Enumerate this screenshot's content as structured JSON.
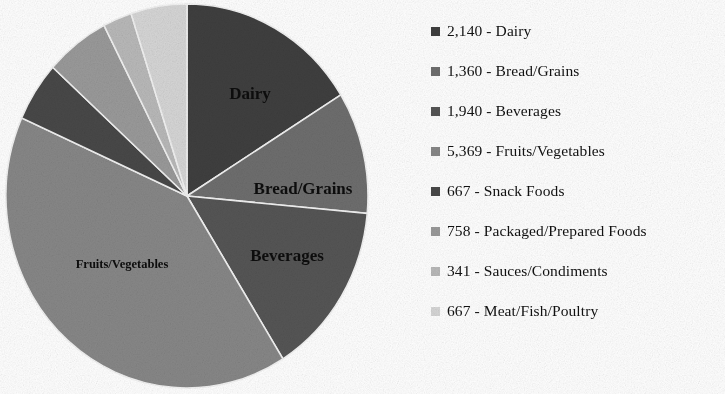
{
  "chart_data": {
    "type": "pie",
    "title": "",
    "legend_position": "right",
    "total": 13242,
    "categories": [
      "Dairy",
      "Bread/Grains",
      "Beverages",
      "Fruits/Vegetables",
      "Snack Foods",
      "Packaged/Prepared Foods",
      "Sauces/Condiments",
      "Meat/Fish/Poultry"
    ],
    "values": [
      2140,
      1360,
      1940,
      5369,
      667,
      758,
      341,
      667
    ],
    "value_labels": [
      "2,140",
      "1,360",
      "1,940",
      "5,369",
      "667",
      "758",
      "341",
      "667"
    ],
    "colors": [
      "#3f3f3f",
      "#6e6e6e",
      "#555555",
      "#878787",
      "#484848",
      "#9a9a9a",
      "#b9b9b9",
      "#d6d6d6"
    ],
    "slices": [
      {
        "label": "Dairy",
        "value": 2140,
        "value_label": "2,140",
        "color": "#3f3f3f",
        "start_angle": 0.0,
        "end_angle": 58.2
      },
      {
        "label": "Bread/Grains",
        "value": 1360,
        "value_label": "1,360",
        "color": "#6e6e6e",
        "start_angle": 58.2,
        "end_angle": 95.2
      },
      {
        "label": "Beverages",
        "value": 1940,
        "value_label": "1,940",
        "color": "#555555",
        "start_angle": 95.2,
        "end_angle": 148.0
      },
      {
        "label": "Fruits/Vegetables",
        "value": 5369,
        "value_label": "5,369",
        "color": "#878787",
        "start_angle": 148.0,
        "end_angle": 294.0
      },
      {
        "label": "Snack Foods",
        "value": 667,
        "value_label": "667",
        "color": "#484848",
        "start_angle": 294.0,
        "end_angle": 312.1
      },
      {
        "label": "Packaged/Prepared Foods",
        "value": 758,
        "value_label": "758",
        "color": "#9a9a9a",
        "start_angle": 312.1,
        "end_angle": 332.7
      },
      {
        "label": "Sauces/Condiments",
        "value": 341,
        "value_label": "341",
        "color": "#b9b9b9",
        "start_angle": 332.7,
        "end_angle": 342.0
      },
      {
        "label": "Meat/Fish/Poultry",
        "value": 667,
        "value_label": "667",
        "color": "#d6d6d6",
        "start_angle": 342.0,
        "end_angle": 360.0
      }
    ],
    "inline_labels": [
      {
        "text": "Dairy",
        "x": 250,
        "y": 95,
        "size": "big"
      },
      {
        "text": "Bread/Grains",
        "x": 303,
        "y": 190,
        "size": "big"
      },
      {
        "text": "Beverages",
        "x": 287,
        "y": 257,
        "size": "big"
      },
      {
        "text": "Fruits/Vegetables",
        "x": 122,
        "y": 265,
        "size": "small"
      }
    ]
  },
  "legend": {
    "items": [
      {
        "value_label": "2,140",
        "separator": "-",
        "label": "Dairy",
        "text": "2,140 - Dairy",
        "color": "#3f3f3f",
        "y": 21
      },
      {
        "value_label": "1,360",
        "separator": "-",
        "label": "Bread/Grains",
        "text": "1,360 - Bread/Grains",
        "color": "#6e6e6e",
        "y": 61
      },
      {
        "value_label": "1,940",
        "separator": "-",
        "label": "Beverages",
        "text": "1,940 - Beverages",
        "color": "#555555",
        "y": 101
      },
      {
        "value_label": "5,369",
        "separator": "-",
        "label": "Fruits/Vegetables",
        "text": "5,369 - Fruits/Vegetables",
        "color": "#878787",
        "y": 141
      },
      {
        "value_label": "667",
        "separator": "-",
        "label": "Snack Foods",
        "text": "667 - Snack Foods",
        "color": "#484848",
        "y": 181
      },
      {
        "value_label": "758",
        "separator": "-",
        "label": "Packaged/Prepared Foods",
        "text": "758 - Packaged/Prepared Foods",
        "color": "#9a9a9a",
        "y": 221
      },
      {
        "value_label": "341",
        "separator": "-",
        "label": "Sauces/Condiments",
        "text": "341 - Sauces/Condiments",
        "color": "#b9b9b9",
        "y": 261
      },
      {
        "value_label": "667",
        "separator": "-",
        "label": "Meat/Fish/Poultry",
        "text": "667 - Meat/Fish/Poultry",
        "color": "#d6d6d6",
        "y": 301
      }
    ]
  },
  "geometry": {
    "center_x": 187,
    "center_y": 196,
    "radius_x": 181,
    "radius_y": 192
  }
}
